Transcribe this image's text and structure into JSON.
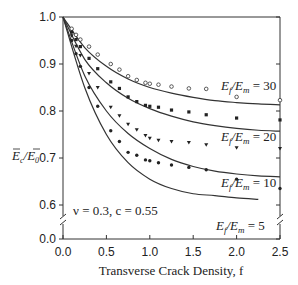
{
  "chart_data": {
    "type": "line",
    "title": "",
    "xlabel": "Transverse Crack Density, f",
    "ylabel": "Ē_c / Ē_0",
    "xlim": [
      0.0,
      2.5
    ],
    "ylim": [
      0.0,
      1.0
    ],
    "y_axis_break": [
      0.0,
      0.6
    ],
    "x_ticks": [
      "0.0",
      "0.5",
      "1.0",
      "1.5",
      "2.0",
      "2.5"
    ],
    "y_ticks": [
      "0.0",
      "0.6",
      "0.7",
      "0.8",
      "0.9",
      "1.0"
    ],
    "grid": false,
    "annotation": "ν = 0.3, c = 0.55",
    "series": [
      {
        "name": "E_f/E_m = 30",
        "label_base": "E",
        "label_sub1": "f",
        "label_mid": "/E",
        "label_sub2": "m",
        "label_val": " = 30",
        "marker": "open-circle",
        "curve_x": [
          0,
          0.25,
          0.5,
          0.75,
          1.0,
          1.25,
          1.5,
          1.75,
          2.0,
          2.25,
          2.5
        ],
        "curve_y": [
          1.0,
          0.935,
          0.895,
          0.868,
          0.85,
          0.838,
          0.829,
          0.822,
          0.818,
          0.815,
          0.813
        ],
        "points_x": [
          0.1,
          0.15,
          0.2,
          0.3,
          0.4,
          0.55,
          0.65,
          0.75,
          0.85,
          0.95,
          1.0,
          1.1,
          1.25,
          1.45,
          1.65,
          2.0,
          2.5
        ],
        "points_y": [
          0.975,
          0.962,
          0.952,
          0.937,
          0.92,
          0.9,
          0.888,
          0.874,
          0.866,
          0.86,
          0.858,
          0.856,
          0.852,
          0.848,
          0.847,
          0.83,
          0.823
        ]
      },
      {
        "name": "E_f/E_m = 20",
        "label_base": "E",
        "label_sub1": "f",
        "label_mid": "/E",
        "label_sub2": "m",
        "label_val": " = 20",
        "marker": "filled-square",
        "curve_x": [
          0,
          0.25,
          0.5,
          0.75,
          1.0,
          1.25,
          1.5,
          1.75,
          2.0,
          2.25,
          2.5
        ],
        "curve_y": [
          1.0,
          0.91,
          0.86,
          0.827,
          0.805,
          0.789,
          0.777,
          0.769,
          0.763,
          0.759,
          0.757
        ],
        "points_x": [
          0.1,
          0.15,
          0.2,
          0.3,
          0.4,
          0.55,
          0.65,
          0.75,
          0.85,
          0.95,
          1.0,
          1.1,
          1.25,
          1.45,
          1.65,
          2.0,
          2.5
        ],
        "points_y": [
          0.968,
          0.952,
          0.937,
          0.912,
          0.89,
          0.862,
          0.848,
          0.83,
          0.82,
          0.812,
          0.81,
          0.808,
          0.802,
          0.798,
          0.792,
          0.785,
          0.781
        ]
      },
      {
        "name": "E_f/E_m = 10",
        "label_base": "E",
        "label_sub1": "f",
        "label_mid": "/E",
        "label_sub2": "m",
        "label_val": " = 10",
        "marker": "filled-triangle-down",
        "curve_x": [
          0,
          0.25,
          0.5,
          0.75,
          1.0,
          1.25,
          1.5,
          1.75,
          2.0,
          2.25,
          2.5
        ],
        "curve_y": [
          1.0,
          0.875,
          0.8,
          0.752,
          0.72,
          0.697,
          0.682,
          0.672,
          0.666,
          0.662,
          0.66
        ],
        "points_x": [
          0.1,
          0.15,
          0.2,
          0.3,
          0.4,
          0.55,
          0.65,
          0.75,
          0.85,
          0.95,
          1.0,
          1.1,
          1.25,
          1.45,
          1.65,
          2.0,
          2.5
        ],
        "points_y": [
          0.96,
          0.938,
          0.918,
          0.88,
          0.85,
          0.808,
          0.79,
          0.772,
          0.76,
          0.748,
          0.742,
          0.738,
          0.735,
          0.733,
          0.728,
          0.722,
          0.72
        ]
      },
      {
        "name": "E_f/E_m = 5",
        "label_base": "E",
        "label_sub1": "f",
        "label_mid": "/E",
        "label_sub2": "m",
        "label_val": " = 5",
        "marker": "filled-circle",
        "curve_x": [
          0,
          0.25,
          0.5,
          0.75,
          1.0,
          1.25,
          1.5,
          1.75,
          2.0,
          2.25
        ],
        "curve_y": [
          1.0,
          0.85,
          0.75,
          0.69,
          0.655,
          0.635,
          0.624,
          0.62,
          0.615,
          0.612
        ],
        "points_x": [
          0.1,
          0.15,
          0.2,
          0.3,
          0.4,
          0.55,
          0.65,
          0.75,
          0.85,
          0.95,
          1.0,
          1.1,
          1.25,
          1.45,
          1.65,
          2.0,
          2.5
        ],
        "points_y": [
          0.95,
          0.922,
          0.895,
          0.85,
          0.81,
          0.758,
          0.735,
          0.712,
          0.706,
          0.696,
          0.694,
          0.69,
          0.685,
          0.68,
          0.675,
          0.655,
          0.635
        ]
      }
    ],
    "layout": {
      "plot_left": 63,
      "plot_right": 280,
      "plot_top": 17,
      "axis_bottom": 239,
      "y_break_top_px": 205,
      "y_break_px": 220
    }
  }
}
